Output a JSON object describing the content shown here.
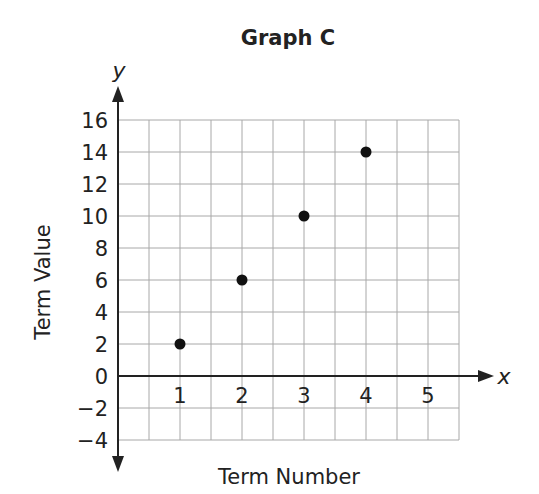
{
  "chart_data": {
    "type": "scatter",
    "title": "Graph C",
    "xlabel": "Term Number",
    "ylabel": "Term Value",
    "x_axis_name": "x",
    "y_axis_name": "y",
    "x": [
      1,
      2,
      3,
      4
    ],
    "y": [
      2,
      6,
      10,
      14
    ],
    "points": [
      [
        1,
        2
      ],
      [
        2,
        6
      ],
      [
        3,
        10
      ],
      [
        4,
        14
      ]
    ],
    "xlim": [
      0,
      5.5
    ],
    "ylim": [
      -4,
      16
    ],
    "x_ticks": [
      "1",
      "2",
      "3",
      "4",
      "5"
    ],
    "y_ticks": [
      "16",
      "14",
      "12",
      "10",
      "8",
      "6",
      "4",
      "2",
      "0",
      "−2",
      "−4"
    ],
    "grid": true,
    "legend": null
  }
}
